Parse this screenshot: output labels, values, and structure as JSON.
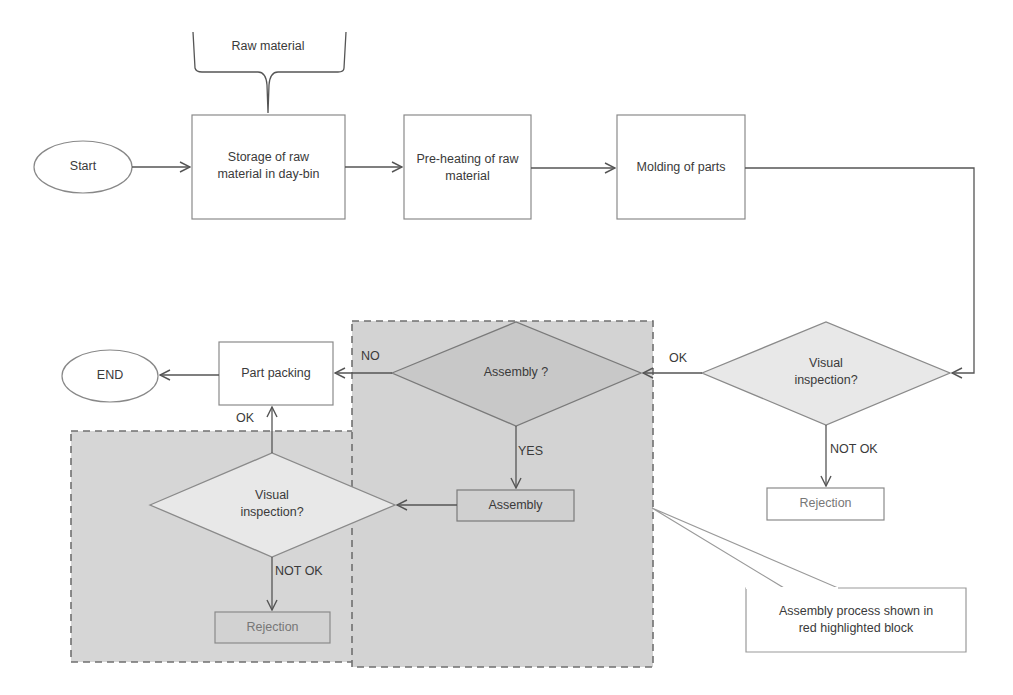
{
  "diagram": {
    "type": "process-flowchart",
    "colors": {
      "line": "#555555",
      "box_border": "#8a8a8a",
      "highlight_fill": "#d4d4d4",
      "highlight_border": "#707070",
      "diamond_fill": "#e6e6e6",
      "text": "#3a3a3a",
      "rejection_text": "#777777"
    },
    "nodes": {
      "raw_material": "Raw material",
      "start": "Start",
      "storage": "Storage of raw\nmaterial in day-bin",
      "preheating": "Pre-heating of raw\nmaterial",
      "molding": "Molding of parts",
      "visual_inspection_1": "Visual\ninspection?",
      "rejection_1": "Rejection",
      "assembly_decision": "Assembly ?",
      "assembly": "Assembly",
      "visual_inspection_2": "Visual\ninspection?",
      "rejection_2": "Rejection",
      "part_packing": "Part packing",
      "end": "END",
      "callout": "Assembly process shown in\nred highlighted block"
    },
    "edge_labels": {
      "vi1_ok": "OK",
      "vi1_not_ok": "NOT OK",
      "assembly_no": "NO",
      "assembly_yes": "YES",
      "vi2_ok": "OK",
      "vi2_not_ok": "NOT OK"
    }
  }
}
